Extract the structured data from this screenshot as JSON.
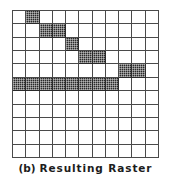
{
  "figure": {
    "caption_label": "(b)",
    "caption_title": "Resulting Raster"
  },
  "chart_data": {
    "type": "heatmap",
    "xlabel": "",
    "ylabel": "",
    "grid": true,
    "legend": null,
    "rows": 11,
    "columns": 11,
    "on_color": "#2a2a2a",
    "off_color": "#ffffff",
    "grid_line_color": "#4a4a4a",
    "row_labels": [
      "0",
      "1",
      "2",
      "3",
      "4",
      "5",
      "6",
      "7",
      "8",
      "9",
      "10"
    ],
    "column_labels": [
      "0",
      "1",
      "2",
      "3",
      "4",
      "5",
      "6",
      "7",
      "8",
      "9",
      "10"
    ],
    "filled_cells": [
      {
        "row": 0,
        "columns": [
          1
        ]
      },
      {
        "row": 1,
        "columns": [
          2,
          3
        ]
      },
      {
        "row": 2,
        "columns": [
          4
        ]
      },
      {
        "row": 3,
        "columns": [
          5,
          6
        ]
      },
      {
        "row": 4,
        "columns": [
          8,
          9
        ]
      },
      {
        "row": 5,
        "columns": [
          0,
          1,
          2,
          3,
          4,
          5,
          6,
          7
        ]
      }
    ],
    "values": [
      [
        0,
        1,
        0,
        0,
        0,
        0,
        0,
        0,
        0,
        0,
        0
      ],
      [
        0,
        0,
        1,
        1,
        0,
        0,
        0,
        0,
        0,
        0,
        0
      ],
      [
        0,
        0,
        0,
        0,
        1,
        0,
        0,
        0,
        0,
        0,
        0
      ],
      [
        0,
        0,
        0,
        0,
        0,
        1,
        1,
        0,
        0,
        0,
        0
      ],
      [
        0,
        0,
        0,
        0,
        0,
        0,
        0,
        0,
        1,
        1,
        0
      ],
      [
        1,
        1,
        1,
        1,
        1,
        1,
        1,
        1,
        0,
        0,
        0
      ],
      [
        0,
        0,
        0,
        0,
        0,
        0,
        0,
        0,
        0,
        0,
        0
      ],
      [
        0,
        0,
        0,
        0,
        0,
        0,
        0,
        0,
        0,
        0,
        0
      ],
      [
        0,
        0,
        0,
        0,
        0,
        0,
        0,
        0,
        0,
        0,
        0
      ],
      [
        0,
        0,
        0,
        0,
        0,
        0,
        0,
        0,
        0,
        0,
        0
      ],
      [
        0,
        0,
        0,
        0,
        0,
        0,
        0,
        0,
        0,
        0,
        0
      ]
    ]
  }
}
